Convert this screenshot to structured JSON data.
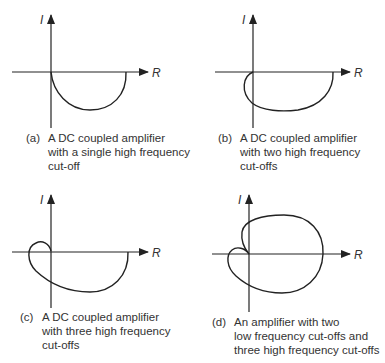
{
  "figure": {
    "axes": {
      "real_label": "R",
      "imag_label": "I"
    },
    "panels": [
      {
        "id": "a",
        "tag": "(a)",
        "caption_lines": [
          "A DC coupled amplifier",
          "with a single high frequency",
          "cut-off"
        ]
      },
      {
        "id": "b",
        "tag": "(b)",
        "caption_lines": [
          "A DC coupled amplifier",
          "with two high frequency",
          "cut-offs"
        ]
      },
      {
        "id": "c",
        "tag": "(c)",
        "caption_lines": [
          "A DC coupled amplifier",
          "with three high frequency",
          "cut-offs"
        ]
      },
      {
        "id": "d",
        "tag": "(d)",
        "caption_lines": [
          "An amplifier with two",
          "low frequency cut-offs and",
          "three high frequency cut-offs"
        ]
      }
    ],
    "colors": {
      "line": "#222222",
      "background": "#ffffff"
    }
  }
}
